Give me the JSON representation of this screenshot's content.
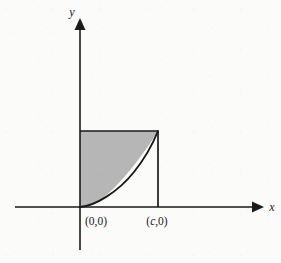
{
  "figure": {
    "background_color": "#fbfbfa",
    "ink_color": "#1a1a1a",
    "shade_color": "#b6b6b6",
    "axes": {
      "x_axis_label": "x",
      "y_axis_label": "y",
      "x_axis_y_pixel": 207,
      "y_axis_x_pixel": 80,
      "x_axis_start": 15,
      "x_axis_end": 258,
      "y_axis_top": 20,
      "y_axis_bottom": 250
    },
    "point_labels": [
      {
        "name": "origin-label",
        "text": "(0,0)",
        "x": 82,
        "y": 224
      },
      {
        "name": "c-label",
        "text_open": "(",
        "text_var": "c",
        "text_close": ",0)",
        "x": 140,
        "y": 224
      }
    ],
    "region": {
      "description": "shaded area between horizontal top edge and curve",
      "left_x": 80,
      "right_x": 158,
      "top_y": 131,
      "bottom_y": 207,
      "curve_type": "convex-increasing",
      "curve_tangent_at_origin": "x-axis"
    }
  }
}
